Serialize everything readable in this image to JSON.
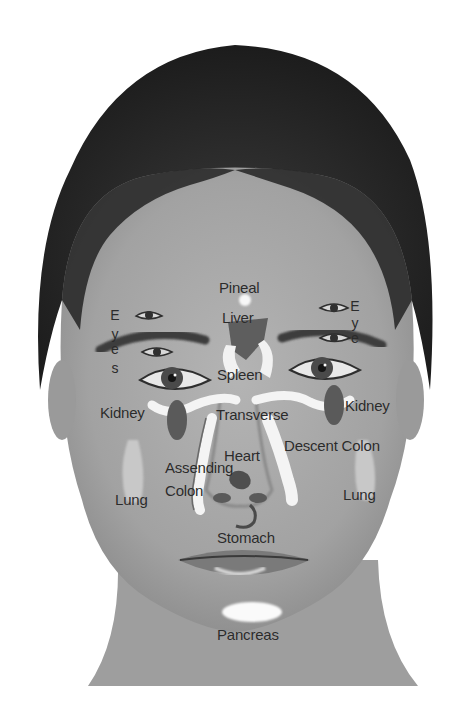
{
  "figure": {
    "background": "#ffffff",
    "colors": {
      "hair": "#262626",
      "skin": "#a9a9a9",
      "skin_light": "#bdbdbd",
      "organ_dark": "#5a5a5a",
      "organ_highlight": "#f4f4f4",
      "label_text": "#2b2b2b"
    }
  },
  "labels": {
    "pineal": "Pineal",
    "liver": "Liver",
    "spleen": "Spleen",
    "eyes_left": [
      "E",
      "y",
      "e",
      "s"
    ],
    "eye_right": [
      "E",
      "y",
      "e"
    ],
    "kidney_left": "Kidney",
    "kidney_right": "Kidney",
    "transverse": "Transverse",
    "heart": "Heart",
    "descent_colon": "Descent Colon",
    "assending": "Assending",
    "colon": "Colon",
    "lung_left": "Lung",
    "lung_right": "Lung",
    "stomach": "Stomach",
    "pancreas": "Pancreas"
  }
}
